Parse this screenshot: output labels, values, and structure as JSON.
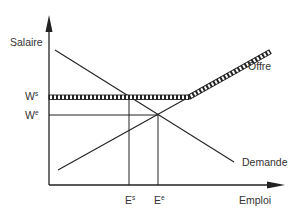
{
  "diagram": {
    "type": "labor-market-minimum-wage",
    "axes": {
      "y_label": "Salaire",
      "x_label": "Emploi"
    },
    "curves": {
      "supply_label": "Offre",
      "demand_label": "Demande"
    },
    "wage_levels": [
      {
        "base": "W",
        "sup": "s",
        "role": "minimum-wage"
      },
      {
        "base": "W",
        "sup": "e",
        "role": "equilibrium-wage"
      }
    ],
    "employment_levels": [
      {
        "base": "E",
        "sup": "s",
        "role": "employment-at-minimum-wage"
      },
      {
        "base": "E",
        "sup": "e",
        "role": "equilibrium-employment"
      }
    ],
    "colors": {
      "line": "#222222",
      "text": "#333333",
      "background": "#ffffff"
    }
  }
}
